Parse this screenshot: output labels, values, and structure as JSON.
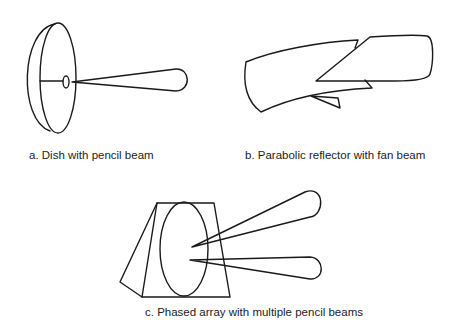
{
  "figure": {
    "panels": [
      {
        "id": "a",
        "caption": "a. Dish with pencil beam",
        "antenna": "dish",
        "beam": "pencil",
        "beam_count": 1
      },
      {
        "id": "b",
        "caption": "b. Parabolic reflector with fan beam",
        "antenna": "parabolic-reflector",
        "beam": "fan",
        "beam_count": 1
      },
      {
        "id": "c",
        "caption": "c. Phased array with multiple pencil beams",
        "antenna": "phased-array",
        "beam": "pencil",
        "beam_count": 2
      }
    ],
    "colors": {
      "line": "#1a1a1a",
      "background": "#ffffff",
      "text": "#222222"
    }
  }
}
